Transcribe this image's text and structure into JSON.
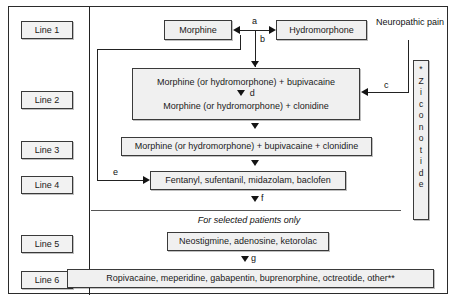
{
  "figure": {
    "note": "For selected patients only"
  },
  "line_labels": [
    {
      "label": "Line 1"
    },
    {
      "label": "Line 2"
    },
    {
      "label": "Line 3"
    },
    {
      "label": "Line 4"
    },
    {
      "label": "Line 5"
    },
    {
      "label": "Line 6"
    }
  ],
  "nodes": {
    "morphine": "Morphine",
    "hydromorphone": "Hydromorphone",
    "neuropathic_pain": "Neuropathic pain",
    "line2_top": "Morphine (or hydromorphone) + bupivacaine",
    "line2_bottom": "Morphine (or hydromorphone) + clonidine",
    "line3": "Morphine (or hydromorphone) + bupivacaine + clonidine",
    "line4": "Fentanyl, sufentanil, midazolam, baclofen",
    "line5": "Neostigmine, adenosine, ketorolac",
    "line6": "Ropivacaine, meperidine, gabapentin, buprenorphine, octreotide, other**"
  },
  "ziconotide": {
    "letters": [
      "*",
      "Z",
      "i",
      "c",
      "o",
      "n",
      "o",
      "t",
      "i",
      "d",
      "e"
    ],
    "full_text": "* Ziconotide"
  },
  "edge_labels": {
    "a": "a",
    "b": "b",
    "c": "c",
    "d": "d",
    "e": "e",
    "f": "f",
    "g": "g"
  },
  "colors": {
    "box_fill": "#f0f0f0",
    "box_border": "#3a3a3a",
    "line": "#222222",
    "text": "#1a1a1a"
  }
}
